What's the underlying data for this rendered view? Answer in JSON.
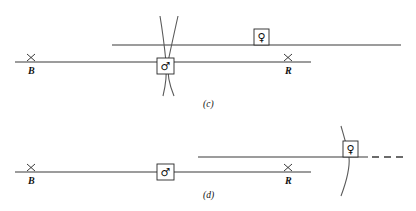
{
  "figure": {
    "background_color": "#ffffff",
    "line_color": "#3b3b3b",
    "curve_color": "#5a5a5a",
    "text_color": "#111111",
    "panels": [
      {
        "id": "panel-c",
        "caption": "(c)",
        "caption_x": 203,
        "caption_y": 100,
        "lines": [
          {
            "name": "upper-axis-line",
            "x1": 112,
            "y1": 45,
            "x2": 401,
            "y2": 45,
            "style": "solid"
          },
          {
            "name": "lower-axis-line",
            "x1": 15,
            "y1": 62,
            "x2": 311,
            "y2": 62,
            "style": "solid"
          }
        ],
        "curves": [
          {
            "name": "worldline-left",
            "path": "M 160 16 C 163 34, 165 52, 166 62 C 167 74, 166 84, 163 96"
          },
          {
            "name": "worldline-right",
            "path": "M 178 16 C 174 34, 170 52, 168 62 C 167 74, 169 84, 174 96"
          }
        ],
        "ticks": [
          {
            "name": "tick-B",
            "x": 31,
            "y": 62
          },
          {
            "name": "tick-R",
            "x": 288,
            "y": 62
          }
        ],
        "labels": [
          {
            "name": "label-B",
            "text": "B",
            "x": 28,
            "y": 66
          },
          {
            "name": "label-R",
            "text": "R",
            "x": 285,
            "y": 66
          }
        ],
        "symbols": [
          {
            "name": "male-symbol-box",
            "glyph": "♂",
            "glyph_label": "mars-male-icon",
            "box_x": 157,
            "box_y": 58,
            "box_w": 17,
            "box_h": 16
          },
          {
            "name": "female-symbol-box",
            "glyph": "♀",
            "glyph_label": "venus-female-icon",
            "box_x": 254,
            "box_y": 29,
            "box_w": 15,
            "box_h": 16
          }
        ]
      },
      {
        "id": "panel-d",
        "caption": "(d)",
        "caption_x": 203,
        "caption_y": 191,
        "lines": [
          {
            "name": "upper-axis-line",
            "x1": 198,
            "y1": 157,
            "x2": 368,
            "y2": 157,
            "style": "solid"
          },
          {
            "name": "upper-axis-line-dashed",
            "x1": 372,
            "y1": 157,
            "x2": 404,
            "y2": 157,
            "style": "dashed"
          },
          {
            "name": "lower-axis-line",
            "x1": 15,
            "y1": 172,
            "x2": 311,
            "y2": 172,
            "style": "solid"
          }
        ],
        "curves": [
          {
            "name": "worldline-single",
            "path": "M 341 126 C 345 140, 348 150, 349 157 C 350 167, 347 180, 341 196"
          }
        ],
        "ticks": [
          {
            "name": "tick-B",
            "x": 31,
            "y": 172
          },
          {
            "name": "tick-R",
            "x": 288,
            "y": 172
          }
        ],
        "labels": [
          {
            "name": "label-B",
            "text": "B",
            "x": 28,
            "y": 176
          },
          {
            "name": "label-R",
            "text": "R",
            "x": 285,
            "y": 176
          }
        ],
        "symbols": [
          {
            "name": "male-symbol-box",
            "glyph": "♂",
            "glyph_label": "mars-male-icon",
            "box_x": 157,
            "box_y": 164,
            "box_w": 17,
            "box_h": 16
          },
          {
            "name": "female-symbol-box",
            "glyph": "♀",
            "glyph_label": "venus-female-icon",
            "box_x": 343,
            "box_y": 141,
            "box_w": 15,
            "box_h": 16
          }
        ]
      }
    ]
  }
}
